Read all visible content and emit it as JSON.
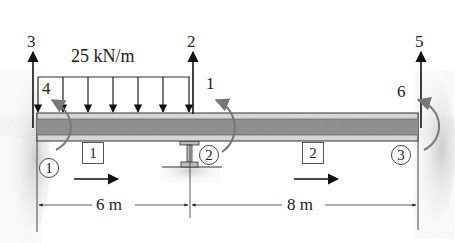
{
  "diagram": {
    "type": "beam-element-dof",
    "distributed_load": {
      "label": "25 kN/m",
      "start_x_m": 0,
      "end_x_m": 6,
      "direction": "down"
    },
    "dof_labels": {
      "dof1": "1",
      "dof2": "2",
      "dof3": "3",
      "dof4": "4",
      "dof5": "5",
      "dof6": "6"
    },
    "nodes": [
      {
        "id": "1",
        "support": "fixed-wall-left"
      },
      {
        "id": "2",
        "support": "roller-I-section"
      },
      {
        "id": "3",
        "support": "fixed-wall-right"
      }
    ],
    "elements": [
      {
        "id": "1",
        "length": "6 m"
      },
      {
        "id": "2",
        "length": "8 m"
      }
    ],
    "dimensions": {
      "span1": "6 m",
      "span2": "8 m"
    },
    "colors": {
      "beam_core": "#8a8a8a",
      "beam_flange": "#d0d0d0",
      "outline": "#333333",
      "moment_arrow": "#7a7a7a",
      "ground": "#d8d8d8"
    }
  }
}
